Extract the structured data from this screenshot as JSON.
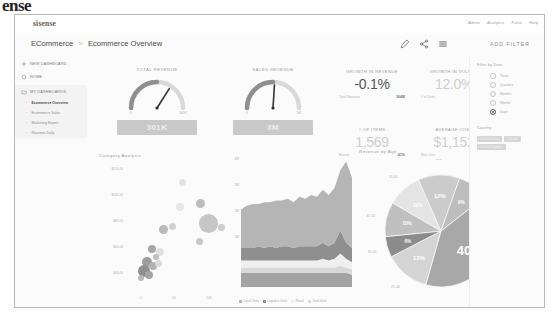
{
  "watermark": "ense",
  "topbar": {
    "logo": "sisense",
    "right_items": [
      "Admin",
      "Analytics",
      "Pulse",
      "Help"
    ]
  },
  "header": {
    "breadcrumb_root": "ECommerce",
    "breadcrumb_sep": ">",
    "breadcrumb_current": "Ecommerce Overview",
    "icons": [
      "pencil-icon",
      "share-icon",
      "menu-icon"
    ],
    "add_filter_label": "ADD FILTER"
  },
  "sidebar": {
    "items": [
      {
        "label": "NEW DASHBOARD",
        "icon": "plus-icon"
      },
      {
        "label": "HOME",
        "icon": "home-icon"
      },
      {
        "label": "MY DASHBOARDS",
        "icon": "folder-icon"
      }
    ],
    "dashboards": [
      {
        "label": "Ecommerce Overview",
        "active": true
      },
      {
        "label": "Ecommerce Sales",
        "active": false
      },
      {
        "label": "Marketing Report",
        "active": false
      },
      {
        "label": "Revenue Daily",
        "active": false
      }
    ]
  },
  "gauges": [
    {
      "title": "TOTAL REVENUE",
      "value": "301K",
      "min": "0",
      "max": "500K",
      "needle_pct": 0.68
    },
    {
      "title": "SALES REVENUE",
      "value": "3M",
      "min": "0",
      "max": "5M",
      "needle_pct": 0.52
    }
  ],
  "kpis": [
    {
      "title": "GROWTH IN REVENUE",
      "value": "-0.1%",
      "tone": "dark",
      "foot_label": "Total Revenue",
      "foot_value": "364M"
    },
    {
      "title": "GROWTH IN VOLUME",
      "value": "12.0%",
      "tone": "light",
      "foot_label": "# of Units",
      "foot_value": "327K"
    },
    {
      "title": "# OF ITEMS",
      "value": "1,569",
      "tone": "light",
      "foot_label": "Brands",
      "foot_value": "41%"
    },
    {
      "title": "AVERAGE COST",
      "value": "$1,152",
      "tone": "light",
      "foot_label": "Max Cost",
      "foot_value": "5.2%"
    }
  ],
  "filters": {
    "section_label": "Filter by Date",
    "options": [
      {
        "label": "Years",
        "selected": false
      },
      {
        "label": "Quarters",
        "selected": false
      },
      {
        "label": "Months",
        "selected": false
      },
      {
        "label": "Weeks",
        "selected": false
      },
      {
        "label": "Days",
        "selected": true
      }
    ],
    "country_label": "Country",
    "tags": [
      "United States",
      "Canada",
      "United Kingdom"
    ]
  },
  "chart_data": [
    {
      "type": "scatter",
      "title": "Category Analysis",
      "xlabel": "",
      "ylabel": "",
      "ytick_labels": [
        "$120.00",
        "$100.00",
        "$80.00",
        "$60.00",
        "$40.00"
      ],
      "xtick_labels": [
        "0",
        "5K",
        "10K"
      ],
      "legend": [
        "Sales",
        "Units Returned",
        "Cost"
      ],
      "legend_position": "bottom",
      "points": [
        {
          "x": 0.56,
          "y": 0.14,
          "r": 3.5,
          "c": "#e2e2e2"
        },
        {
          "x": 0.74,
          "y": 0.3,
          "r": 4.5,
          "c": "#bdbdbd"
        },
        {
          "x": 0.54,
          "y": 0.33,
          "r": 4.0,
          "c": "#e6e6e6"
        },
        {
          "x": 0.82,
          "y": 0.46,
          "r": 9.5,
          "c": "#c6c6c6"
        },
        {
          "x": 0.38,
          "y": 0.5,
          "r": 4.5,
          "c": "#bababa"
        },
        {
          "x": 0.47,
          "y": 0.48,
          "r": 3.5,
          "c": "#d0d0d0"
        },
        {
          "x": 0.95,
          "y": 0.49,
          "r": 3.5,
          "c": "#cdcdcd"
        },
        {
          "x": 0.73,
          "y": 0.6,
          "r": 3.5,
          "c": "#c8c8c8"
        },
        {
          "x": 0.26,
          "y": 0.66,
          "r": 4.0,
          "c": "#a8a8a8"
        },
        {
          "x": 0.34,
          "y": 0.68,
          "r": 4.0,
          "c": "#e0e0e0"
        },
        {
          "x": 0.3,
          "y": 0.72,
          "r": 3.0,
          "c": "#bdbdbd"
        },
        {
          "x": 0.22,
          "y": 0.76,
          "r": 5.0,
          "c": "#9d9d9d"
        },
        {
          "x": 0.27,
          "y": 0.79,
          "r": 4.0,
          "c": "#b2b2b2"
        },
        {
          "x": 0.33,
          "y": 0.77,
          "r": 3.5,
          "c": "#d9d9d9"
        },
        {
          "x": 0.19,
          "y": 0.83,
          "r": 6.0,
          "c": "#8f8f8f"
        },
        {
          "x": 0.24,
          "y": 0.86,
          "r": 4.0,
          "c": "#a5a5a5"
        },
        {
          "x": 0.16,
          "y": 0.88,
          "r": 3.0,
          "c": "#b8b8b8"
        }
      ]
    },
    {
      "type": "area",
      "title": "",
      "stacked": true,
      "legend": [
        "Local Units",
        "Logistics Units",
        "Retail",
        "Total Units",
        "Online Sales Quantity"
      ],
      "legend_position": "bottom",
      "ytick_labels": [
        "4M",
        "3M",
        "2M",
        "1M"
      ],
      "series": [
        {
          "name": "Local Units",
          "color": "#b5b5b5",
          "values": [
            22,
            24,
            25,
            24,
            26,
            25,
            27,
            26,
            27,
            26,
            28,
            27,
            29,
            28,
            30,
            29,
            31,
            34,
            46,
            40
          ]
        },
        {
          "name": "Logistics Units",
          "color": "#8f8f8f",
          "values": [
            7,
            7,
            7,
            8,
            7,
            8,
            7,
            8,
            8,
            7,
            8,
            8,
            8,
            8,
            9,
            8,
            9,
            13,
            9,
            8
          ]
        },
        {
          "name": "Retail",
          "color": "#efefef",
          "values": [
            4,
            4,
            4,
            4,
            4,
            4,
            4,
            4,
            4,
            4,
            4,
            4,
            4,
            4,
            5,
            4,
            5,
            7,
            5,
            4
          ]
        },
        {
          "name": "Total Units",
          "color": "#d8d8d8",
          "values": [
            3,
            3,
            3,
            3,
            3,
            3,
            3,
            3,
            3,
            3,
            3,
            3,
            3,
            3,
            3,
            3,
            3,
            4,
            3,
            3
          ]
        },
        {
          "name": "Online Sales Quantity",
          "color": "#a3a3a3",
          "values": [
            8,
            8,
            8,
            8,
            8,
            8,
            8,
            8,
            8,
            8,
            8,
            8,
            8,
            8,
            8,
            8,
            8,
            8,
            8,
            7
          ]
        }
      ]
    },
    {
      "type": "pie",
      "title": "Revenue by Age",
      "labels": [
        "65+",
        "0-18",
        "19-24",
        "25-34",
        "35-44",
        "45-54",
        "55-64"
      ],
      "values": [
        40,
        13,
        6,
        10,
        10,
        12,
        9
      ],
      "display_values": [
        "40%",
        "13%",
        "6%",
        "10%",
        "10%",
        "12%",
        "9%"
      ],
      "colors": [
        "#a8a8a8",
        "#d4d4d4",
        "#8c8c8c",
        "#c0c0c0",
        "#e4e4e4",
        "#cbcbcb",
        "#bdbdbd"
      ],
      "outer_labels": [
        "19-24",
        "25-34",
        "35-44",
        "45-54",
        "55-64",
        "65+",
        "0-18"
      ]
    }
  ]
}
